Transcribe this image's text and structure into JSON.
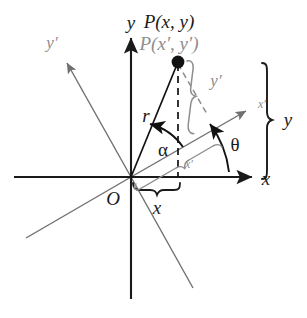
{
  "figure": {
    "type": "coordinate-rotation-diagram",
    "background_color": "#ffffff",
    "colors": {
      "primary_axis": "#1a1a1a",
      "rotated_axis": "#6f6f6f",
      "primed_label": "#8d8d8d",
      "point_fill": "#111111",
      "brace_black": "#1a1a1a",
      "brace_gray": "#8d8d8d"
    },
    "labels": {
      "point_xy": "P(x, y)",
      "point_xy_prime": "P(x′, y′)",
      "axis_y": "y",
      "axis_x": "x",
      "axis_y_prime": "y′",
      "axis_x_prime": "x′",
      "origin": "O",
      "radius": "r",
      "angle_alpha": "α",
      "angle_theta": "θ",
      "brace_y": "y",
      "brace_x": "x",
      "brace_y_prime": "y′",
      "brace_x_prime": "x′"
    },
    "geometry": {
      "origin": {
        "x": 131,
        "y": 177
      },
      "point_P": {
        "x": 178,
        "y": 62
      },
      "x_axis": {
        "from_x": 14,
        "to_x": 256,
        "y": 177
      },
      "y_axis": {
        "x": 131,
        "from_y": 299,
        "to_y": 34
      },
      "x_prime_axis_tip": {
        "x": 250,
        "y": 108
      },
      "y_prime_axis_tip": {
        "x": 64,
        "y": 59
      },
      "rotation_angle_theta_deg": 30,
      "angle_alpha_deg": 38
    }
  }
}
